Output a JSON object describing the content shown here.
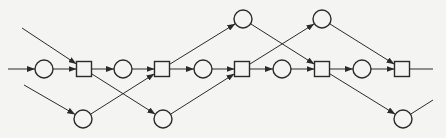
{
  "diagram": {
    "type": "petri-net",
    "background": "#f4f4f2",
    "stroke": "#2a2a2a",
    "places": [
      {
        "id": "p1",
        "x": 44,
        "y": 69
      },
      {
        "id": "p2",
        "x": 123,
        "y": 69
      },
      {
        "id": "p3",
        "x": 203,
        "y": 69
      },
      {
        "id": "p4",
        "x": 282,
        "y": 69
      },
      {
        "id": "p5",
        "x": 362,
        "y": 69
      },
      {
        "id": "pt1",
        "x": 243,
        "y": 19
      },
      {
        "id": "pt2",
        "x": 322,
        "y": 19
      },
      {
        "id": "pb1",
        "x": 83,
        "y": 119
      },
      {
        "id": "pb2",
        "x": 163,
        "y": 119
      },
      {
        "id": "pb3",
        "x": 403,
        "y": 119
      }
    ],
    "transitions": [
      {
        "id": "t1",
        "x": 84,
        "y": 69
      },
      {
        "id": "t2",
        "x": 162,
        "y": 69
      },
      {
        "id": "t3",
        "x": 242,
        "y": 69
      },
      {
        "id": "t4",
        "x": 322,
        "y": 69
      },
      {
        "id": "t5",
        "x": 402,
        "y": 69
      }
    ],
    "arcs": [
      {
        "from": [
          8,
          69
        ],
        "to": "p1"
      },
      {
        "from": "p1",
        "to": "t1"
      },
      {
        "from": [
          22,
          28
        ],
        "to": "t1"
      },
      {
        "from": [
          24,
          85
        ],
        "to": "pb1"
      },
      {
        "from": "t1",
        "to": "p2"
      },
      {
        "from": "t1",
        "to": "pb2"
      },
      {
        "from": "p2",
        "to": "t2"
      },
      {
        "from": "pb1",
        "to": "t2"
      },
      {
        "from": "t2",
        "to": "p3"
      },
      {
        "from": "t2",
        "to": "pt1"
      },
      {
        "from": "p3",
        "to": "t3"
      },
      {
        "from": "pb2",
        "to": "t3"
      },
      {
        "from": "t3",
        "to": "p4"
      },
      {
        "from": "t3",
        "to": "pt2"
      },
      {
        "from": "p4",
        "to": "t4"
      },
      {
        "from": "pt1",
        "to": "t4"
      },
      {
        "from": "t4",
        "to": "p5"
      },
      {
        "from": "t4",
        "to": "pb3"
      },
      {
        "from": "p5",
        "to": "t5"
      },
      {
        "from": "pt2",
        "to": "t5"
      },
      {
        "from": "t5",
        "to": [
          433,
          69
        ],
        "arrow": false
      },
      {
        "from": "pb3",
        "to": [
          433,
          100
        ],
        "arrow": false
      }
    ]
  }
}
